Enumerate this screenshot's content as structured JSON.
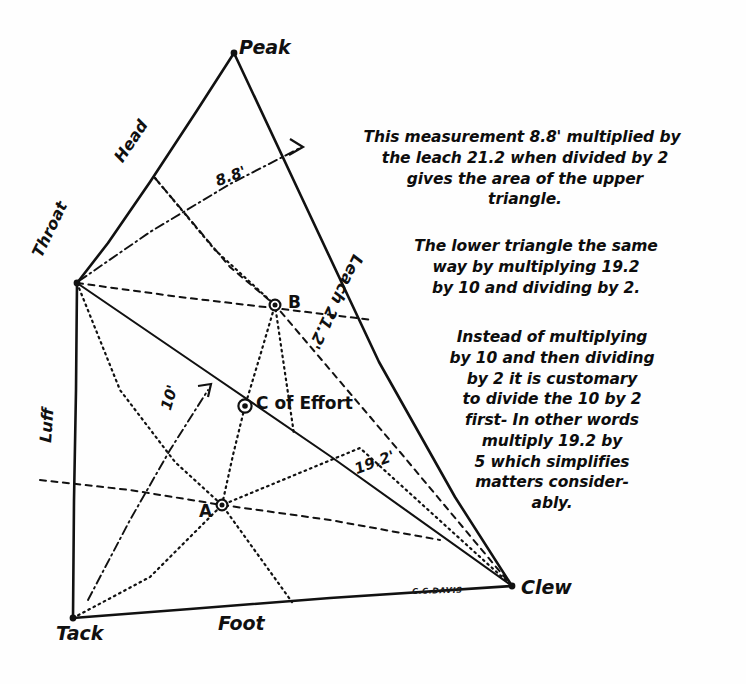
{
  "figure": {
    "signature": "C.C.DAVIS",
    "ink_color": "#111111",
    "paper_color": "#fefefe"
  },
  "vertices": [
    {
      "key": "peak",
      "label": "Peak",
      "x": 234,
      "y": 53
    },
    {
      "key": "throat",
      "label": "Throat",
      "x": 77,
      "y": 283
    },
    {
      "key": "tack",
      "label": "Tack",
      "x": 73,
      "y": 618
    },
    {
      "key": "clew",
      "label": "Clew",
      "x": 512,
      "y": 586
    }
  ],
  "edges": [
    {
      "key": "head",
      "label": "Head",
      "from": "peak",
      "to": "throat"
    },
    {
      "key": "leach",
      "label": "Leach 21.2'",
      "from": "peak",
      "to": "clew"
    },
    {
      "key": "luff",
      "label": "Luff",
      "from": "throat",
      "to": "tack"
    },
    {
      "key": "foot",
      "label": "Foot",
      "from": "tack",
      "to": "clew"
    },
    {
      "key": "diagonal",
      "label": "19.2'",
      "from": "throat",
      "to": "clew"
    }
  ],
  "measurements": [
    {
      "key": "upper-altitude",
      "label": "8.8'",
      "value": 8.8,
      "unit": "ft",
      "description": "perpendicular from Throat to the leach of the upper triangle"
    },
    {
      "key": "leach",
      "label": "Leach 21.2'",
      "value": 21.2,
      "unit": "ft",
      "description": "length of the leach, Peak to Clew"
    },
    {
      "key": "lower-base",
      "label": "19.2'",
      "value": 19.2,
      "unit": "ft",
      "description": "Throat to Clew diagonal, base of the lower triangle"
    },
    {
      "key": "lower-altitude",
      "label": "10'",
      "value": 10,
      "unit": "ft",
      "description": "perpendicular from Tack to the Throat-Clew diagonal"
    }
  ],
  "points": [
    {
      "key": "point-b",
      "label": "B",
      "x": 275,
      "y": 305,
      "description": "centroid of the upper triangle"
    },
    {
      "key": "point-a",
      "label": "A",
      "x": 222,
      "y": 505,
      "description": "centroid of the lower triangle"
    },
    {
      "key": "centre-of-effort",
      "label": "C of Effort",
      "x": 245,
      "y": 406,
      "description": "combined centre of effort on the line A-B"
    }
  ],
  "notes": [
    {
      "key": "note-upper-triangle",
      "lines": [
        "This measurement 8.8' multiplied by",
        "the leach 21.2 when divided by 2",
        "gives the area of the upper",
        "triangle."
      ]
    },
    {
      "key": "note-lower-triangle",
      "lines": [
        "The lower triangle the same",
        "way by multiplying 19.2",
        "by 10 and dividing by 2."
      ]
    },
    {
      "key": "note-shortcut",
      "lines": [
        "Instead of multiplying",
        "by 10 and then dividing",
        "by 2 it is customary",
        "to divide the 10 by 2",
        "first- In other words",
        "multiply 19.2 by",
        "5 which simplifies",
        "matters consider-",
        "ably."
      ]
    }
  ]
}
